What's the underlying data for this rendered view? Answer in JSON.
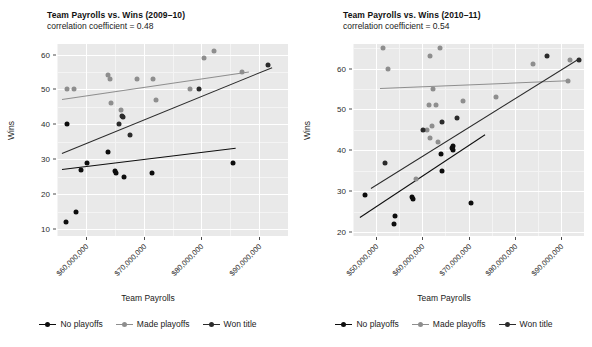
{
  "axis": {
    "x_title": "Team Payrolls",
    "y_title": "Wins"
  },
  "legend": {
    "items": [
      {
        "label": "No playoffs",
        "color": "#0d0d0d",
        "key": "no-playoffs"
      },
      {
        "label": "Made playoffs",
        "color": "#8e8e8e",
        "key": "made-playoffs"
      },
      {
        "label": "Won title",
        "color": "#2b2b2b",
        "key": "won-title"
      }
    ]
  },
  "chart_data": [
    {
      "type": "scatter",
      "id": "payrolls-wins-2009-10",
      "title": "Team Payrolls vs. Wins (2009–10)",
      "subtitle": "correlation coefficient = 0.48",
      "xlabel": "Team Payrolls",
      "ylabel": "Wins",
      "xlim": [
        55000000,
        95000000
      ],
      "ylim": [
        8,
        63
      ],
      "grid": true,
      "legend_position": "bottom",
      "xticks": [
        60000000,
        70000000,
        80000000,
        90000000
      ],
      "xtick_labels": [
        "$60,000,000",
        "$70,000,000",
        "$80,000,000",
        "$90,000,000"
      ],
      "yticks": [
        10,
        20,
        30,
        40,
        50,
        60
      ],
      "ytick_labels": [
        "10",
        "20",
        "30",
        "40",
        "50",
        "60"
      ],
      "series": [
        {
          "name": "No playoffs",
          "color": "#0d0d0d",
          "points": [
            [
              56800000,
              40
            ],
            [
              56600000,
              12
            ],
            [
              58300000,
              15
            ],
            [
              59200000,
              27
            ],
            [
              60200000,
              29
            ],
            [
              63900000,
              32
            ],
            [
              65000000,
              26.6
            ],
            [
              65200000,
              26.2
            ],
            [
              66600000,
              25
            ],
            [
              71500000,
              26
            ],
            [
              85500000,
              29
            ]
          ],
          "fit_line": {
            "x0": 55800000,
            "y0": 27.1,
            "x1": 85800000,
            "y1": 33.2
          }
        },
        {
          "name": "Made playoffs",
          "color": "#8e8e8e",
          "points": [
            [
              56700000,
              50
            ],
            [
              58000000,
              50
            ],
            [
              63800000,
              54
            ],
            [
              64100000,
              53
            ],
            [
              64300000,
              46
            ],
            [
              66100000,
              44
            ],
            [
              68900000,
              53
            ],
            [
              71700000,
              53
            ],
            [
              72100000,
              47
            ],
            [
              78000000,
              50
            ],
            [
              80400000,
              59
            ],
            [
              82200000,
              61
            ],
            [
              87000000,
              55
            ]
          ],
          "fit_line": {
            "x0": 55800000,
            "y0": 47.2,
            "x1": 88200000,
            "y1": 55.1
          }
        },
        {
          "name": "Won title",
          "color": "#2b2b2b",
          "points": [
            [
              65800000,
              40
            ],
            [
              66500000,
              42
            ],
            [
              66200000,
              42.3
            ],
            [
              67600000,
              37
            ],
            [
              79500000,
              50
            ],
            [
              91500000,
              57
            ]
          ],
          "fit_line": {
            "x0": 55800000,
            "y0": 31.9,
            "x1": 92200000,
            "y1": 56.5
          }
        }
      ]
    },
    {
      "type": "scatter",
      "id": "payrolls-wins-2010-11",
      "title": "Team Payrolls vs. Wins (2010–11)",
      "subtitle": "correlation coefficient = 0.54",
      "xlabel": "Team Payrolls",
      "ylabel": "Wins",
      "xlim": [
        45000000,
        95000000
      ],
      "ylim": [
        19,
        66
      ],
      "grid": true,
      "legend_position": "bottom",
      "xticks": [
        50000000,
        60000000,
        70000000,
        80000000,
        90000000
      ],
      "xtick_labels": [
        "$50,000,000",
        "$60,000,000",
        "$70,000,000",
        "$80,000,000",
        "$90,000,000"
      ],
      "yticks": [
        20,
        30,
        40,
        50,
        60
      ],
      "ytick_labels": [
        "20",
        "30",
        "40",
        "50",
        "60"
      ],
      "series": [
        {
          "name": "No playoffs",
          "color": "#0d0d0d",
          "points": [
            [
              47500000,
              29
            ],
            [
              54000000,
              24
            ],
            [
              53900000,
              22
            ],
            [
              57800000,
              28.5
            ],
            [
              57900000,
              28.0
            ],
            [
              64200000,
              35
            ],
            [
              64000000,
              39
            ],
            [
              66500000,
              40.5
            ],
            [
              66700000,
              40.0
            ],
            [
              66600000,
              41
            ],
            [
              70600000,
              27
            ]
          ],
          "fit_line": {
            "x0": 46500000,
            "y0": 23.6,
            "x1": 73500000,
            "y1": 43.8
          }
        },
        {
          "name": "Made playoffs",
          "color": "#8e8e8e",
          "points": [
            [
              51500000,
              65
            ],
            [
              52600000,
              60
            ],
            [
              58700000,
              33
            ],
            [
              61700000,
              63
            ],
            [
              63800000,
              65
            ],
            [
              62200000,
              55
            ],
            [
              61500000,
              51
            ],
            [
              63000000,
              51
            ],
            [
              62100000,
              46
            ],
            [
              61000000,
              45
            ],
            [
              61700000,
              43
            ],
            [
              63400000,
              42
            ],
            [
              68700000,
              52
            ],
            [
              76000000,
              53
            ],
            [
              84000000,
              61
            ],
            [
              92000000,
              62
            ],
            [
              91500000,
              57
            ]
          ],
          "fit_line": {
            "x0": 50800000,
            "y0": 55.3,
            "x1": 91500000,
            "y1": 57.2
          }
        },
        {
          "name": "Won title",
          "color": "#2b2b2b",
          "points": [
            [
              52000000,
              37
            ],
            [
              60200000,
              45
            ],
            [
              64300000,
              47
            ],
            [
              67400000,
              48
            ],
            [
              87000000,
              63
            ],
            [
              93800000,
              62
            ]
          ],
          "fit_line": {
            "x0": 48800000,
            "y0": 30.8,
            "x1": 93800000,
            "y1": 62.5
          }
        }
      ]
    }
  ]
}
